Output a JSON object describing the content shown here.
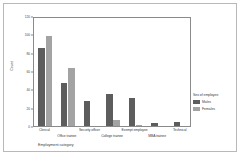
{
  "chart_data": {
    "type": "bar",
    "title": "",
    "xlabel": "Employment category",
    "ylabel": "Count",
    "categories": [
      "Clerical",
      "Office trainee",
      "Security officer",
      "College trainee",
      "Exempt employee",
      "MBA trainee",
      "Technical"
    ],
    "series": [
      {
        "name": "Males",
        "color": "#5d5d5d",
        "values": [
          85,
          47,
          27,
          35,
          31,
          3,
          4
        ]
      },
      {
        "name": "Females",
        "color": "#a3a3a3",
        "values": [
          98,
          63,
          0,
          7,
          1,
          0,
          0
        ]
      }
    ],
    "ylim": [
      0,
      120
    ],
    "yticks": [
      0,
      20,
      40,
      60,
      80,
      100,
      120
    ],
    "ytick_labels": [
      "0",
      "20",
      "40",
      "60",
      "80",
      "100",
      "120"
    ],
    "grid": false,
    "legend": {
      "title": "Sex of employee",
      "position": "right",
      "entries": [
        {
          "label": "Males",
          "color": "#5d5d5d"
        },
        {
          "label": "Females",
          "color": "#a3a3a3"
        }
      ]
    }
  },
  "colors": {
    "males": "#5d5d5d",
    "females": "#a3a3a3",
    "axis": "#8a8a8a",
    "text": "#3a3a3a",
    "border": "#b9b9b9",
    "background": "#ffffff"
  }
}
